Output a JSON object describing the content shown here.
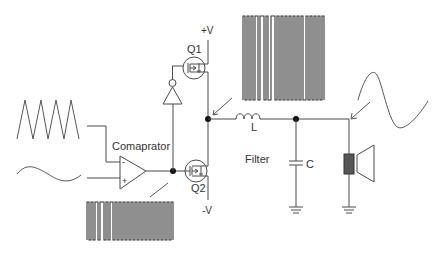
{
  "diagram": {
    "labels": {
      "comparator": "Comaprator",
      "q1": "Q1",
      "q2": "Q2",
      "pos_supply": "+V",
      "neg_supply": "-V",
      "inductor": "L",
      "capacitor": "C",
      "filter": "Filter",
      "minus": "-",
      "plus": "+"
    },
    "signals": {
      "triangle_input": "triangle-wave",
      "audio_input": "sine-wave",
      "pwm_after_comparator": "pwm-pulse-train",
      "pwm_after_switches": "pwm-pulse-train",
      "output": "sine-wave"
    },
    "components": [
      {
        "id": "comparator",
        "type": "op-amp comparator"
      },
      {
        "id": "inverter",
        "type": "inverter (NOT gate)"
      },
      {
        "id": "Q1",
        "type": "MOSFET high-side switch"
      },
      {
        "id": "Q2",
        "type": "MOSFET low-side switch"
      },
      {
        "id": "L",
        "type": "inductor"
      },
      {
        "id": "C",
        "type": "capacitor"
      },
      {
        "id": "speaker",
        "type": "loudspeaker"
      },
      {
        "id": "ground1",
        "type": "ground"
      },
      {
        "id": "ground2",
        "type": "ground"
      }
    ],
    "colors": {
      "line": "#4a4a4a",
      "node": "#111111",
      "speaker_coil": "#555555"
    }
  }
}
